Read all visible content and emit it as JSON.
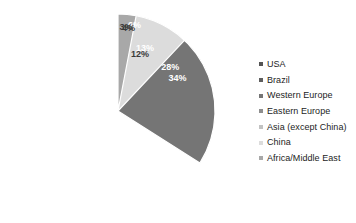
{
  "chart_data": {
    "type": "pie",
    "title": "",
    "categories": [
      "USA",
      "Brazil",
      "Western Europe",
      "Eastern Europe",
      "Asia (except China)",
      "China",
      "Africa/Middle East"
    ],
    "values": [
      13,
      28,
      34,
      6,
      4,
      12,
      3
    ],
    "value_labels": [
      "13%",
      "28%",
      "34%",
      "6%",
      "4%",
      "12%",
      "3%"
    ],
    "unit": "%",
    "start_angle": 0,
    "direction": "clockwise",
    "legend_position": "right",
    "grid": false,
    "colors": [
      "#545454",
      "#5e5e5e",
      "#757575",
      "#8e8e8e",
      "#c2c2c2",
      "#dcdcdc",
      "#a8a8a8"
    ],
    "label_colors": [
      "#ffffff",
      "#ffffff",
      "#ffffff",
      "#ffffff",
      "#3a3a3a",
      "#3a3a3a",
      "#3a3a3a"
    ],
    "separator_color": "#ffffff",
    "background": "#ffffff"
  },
  "legend": {
    "items": [
      {
        "label": "USA",
        "color": "#545454"
      },
      {
        "label": "Brazil",
        "color": "#5e5e5e"
      },
      {
        "label": "Western Europe",
        "color": "#757575"
      },
      {
        "label": "Eastern Europe",
        "color": "#8e8e8e"
      },
      {
        "label": "Asia (except China)",
        "color": "#c2c2c2"
      },
      {
        "label": "China",
        "color": "#dcdcdc"
      },
      {
        "label": "Africa/Middle East",
        "color": "#a8a8a8"
      }
    ]
  },
  "geometry": {
    "cx": 118,
    "cy": 111,
    "r": 97,
    "label_radius_ratio": 0.7
  }
}
